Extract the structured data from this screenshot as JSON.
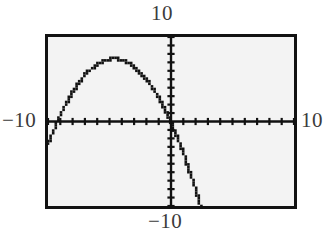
{
  "labels": {
    "top": "10",
    "bottom": "−10",
    "left": "−10",
    "right": "10"
  },
  "colors": {
    "frame": "#121212",
    "screen_background": "#f3f3f3",
    "curve": "#111111",
    "axis": "#111111",
    "label_text": "#3b3b3b",
    "page_background": "#ffffff"
  },
  "chart_data": {
    "type": "line",
    "title": "",
    "xlabel": "",
    "ylabel": "",
    "xlim": [
      -10,
      10
    ],
    "ylim": [
      -10,
      10
    ],
    "grid": false,
    "legend": "none",
    "xticks_interval": 1,
    "yticks_interval": 1,
    "axis_end_labels": {
      "x_min": "−10",
      "x_max": "10",
      "y_min": "−10",
      "y_max": "10"
    },
    "series": [
      {
        "name": "parabola",
        "style": "pixelated-dotted",
        "vertex": [
          -3.6,
          6.2
        ],
        "x_intercepts": [
          -7.7,
          0.6
        ],
        "y_intercept": 4.9,
        "opens": "down",
        "x": [
          -10.0,
          -9.5,
          -9.0,
          -8.5,
          -8.0,
          -7.5,
          -7.0,
          -6.5,
          -6.0,
          -5.5,
          -5.0,
          -4.5,
          -4.0,
          -3.6,
          -3.0,
          -2.5,
          -2.0,
          -1.5,
          -1.0,
          -0.5,
          0.0,
          0.5,
          1.0,
          1.5,
          2.0,
          2.5
        ],
        "y": [
          -2.7,
          -0.9,
          0.7,
          2.2,
          3.5,
          4.6,
          5.5,
          6.2,
          6.8,
          7.1,
          7.3,
          7.3,
          7.1,
          7.0,
          6.5,
          5.9,
          5.1,
          4.1,
          2.9,
          1.5,
          -0.1,
          -1.9,
          -3.9,
          -6.1,
          -8.5,
          -10.0
        ]
      }
    ]
  }
}
